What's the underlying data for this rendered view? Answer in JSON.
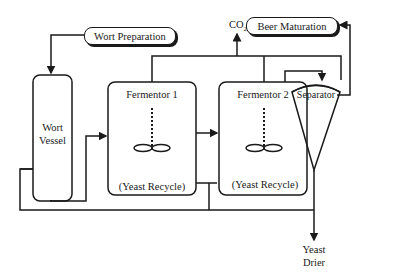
{
  "diagram": {
    "nodes": {
      "wort_preparation": "Wort Preparation",
      "wort_vessel_line1": "Wort",
      "wort_vessel_line2": "Vessel",
      "fermentor1": "Fermentor 1",
      "fermentor2": "Fermentor 2",
      "separator": "Separator",
      "beer_maturation": "Beer Maturation",
      "co2_main": "CO",
      "co2_sub": "2",
      "yeast_drier_line1": "Yeast",
      "yeast_drier_line2": "Drier"
    },
    "annotations": {
      "yeast_recycle_1": "(Yeast Recycle)",
      "yeast_recycle_2": "(Yeast Recycle)"
    },
    "colors": {
      "line": "#1a1a1a",
      "background": "#ffffff"
    }
  }
}
